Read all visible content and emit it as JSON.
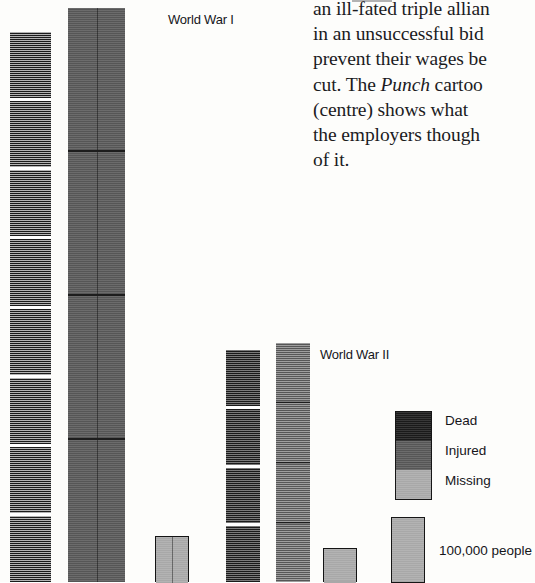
{
  "page": {
    "background_color": "#fdfdfb"
  },
  "body_copy": {
    "lines": [
      "an ill-fated triple allian",
      "in an unsuccessful bid",
      "prevent their wages be",
      "cut. The Punch cartoo",
      "(centre) shows what",
      "the employers though",
      "of it."
    ],
    "italic_word": "Punch"
  },
  "chart_data": {
    "type": "bar",
    "title": "",
    "subtitle": "",
    "xlabel": "",
    "ylabel": "",
    "grid": false,
    "legend_position": "right",
    "unit": "people",
    "scale_block": 100000,
    "group_labels": [
      "World War I",
      "World War II"
    ],
    "categories": [
      "Dead",
      "Injured",
      "Missing"
    ],
    "colors": {
      "dead": "#1a1a1a",
      "injured": "#565656",
      "missing": "#a8a8a8"
    },
    "bars": [
      {
        "id": "ww1-dead",
        "group": "World War I",
        "category": "Dead",
        "color": "#1a1a1a",
        "blocks": 8,
        "value": 800000,
        "x": 10,
        "width": 41,
        "top": 32,
        "split": false,
        "outlined": false
      },
      {
        "id": "ww1-injured",
        "group": "World War I",
        "category": "Injured",
        "color": "#565656",
        "blocks": 4,
        "value": 2000000,
        "x": 68,
        "width": 57,
        "top": 8,
        "split": true,
        "outlined": false
      },
      {
        "id": "ww1-missing",
        "group": "World War I",
        "category": "Missing",
        "color": "#a8a8a8",
        "blocks": 1,
        "value": 100000,
        "x": 155,
        "width": 34,
        "top": 536,
        "split": true,
        "outlined": true
      },
      {
        "id": "ww2-dead",
        "group": "World War II",
        "category": "Dead",
        "color": "#1a1a1a",
        "blocks": 4,
        "value": 400000,
        "x": 226,
        "width": 34,
        "top": 350,
        "split": false,
        "outlined": false
      },
      {
        "id": "ww2-injured",
        "group": "World War II",
        "category": "Injured",
        "color": "#565656",
        "blocks": 4,
        "value": 400000,
        "x": 276,
        "width": 34,
        "top": 343,
        "split": false,
        "outlined": false
      },
      {
        "id": "ww2-missing",
        "group": "World War II",
        "category": "Missing",
        "color": "#a8a8a8",
        "blocks": 1,
        "value": 90000,
        "x": 323,
        "width": 34,
        "top": 548,
        "split": false,
        "outlined": true
      }
    ]
  },
  "chart_labels": {
    "ww1": "World War I",
    "ww2": "World War II"
  },
  "legend": {
    "items": [
      {
        "label": "Dead",
        "color": "#1a1a1a"
      },
      {
        "label": "Injured",
        "color": "#565656"
      },
      {
        "label": "Missing",
        "color": "#a8a8a8"
      }
    ]
  },
  "scale_key": {
    "label": "100,000 people",
    "color": "#a8a8a8"
  }
}
